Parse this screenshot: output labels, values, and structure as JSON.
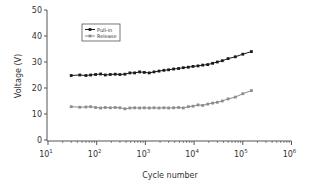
{
  "chart_data": {
    "type": "line",
    "title": "",
    "xlabel": "Cycle number",
    "ylabel": "Voltage (V)",
    "xscale": "log",
    "xlim": [
      10,
      1000000
    ],
    "ylim": [
      0,
      50
    ],
    "grid": false,
    "legend_position": "upper-left (inside)",
    "x_ticks": [
      {
        "base": "10",
        "exp": "1",
        "value": 10
      },
      {
        "base": "10",
        "exp": "2",
        "value": 100
      },
      {
        "base": "10",
        "exp": "3",
        "value": 1000
      },
      {
        "base": "10",
        "exp": "4",
        "value": 10000
      },
      {
        "base": "10",
        "exp": "5",
        "value": 100000
      },
      {
        "base": "10",
        "exp": "6",
        "value": 1000000
      }
    ],
    "y_ticks": [
      "0",
      "10",
      "20",
      "30",
      "40",
      "50"
    ],
    "series": [
      {
        "name": "Pull-in",
        "color": "#1a1a1a",
        "marker": "square",
        "x": [
          30,
          45,
          60,
          75,
          95,
          120,
          150,
          190,
          240,
          300,
          380,
          480,
          600,
          760,
          950,
          1200,
          1500,
          1900,
          2400,
          3000,
          3800,
          4800,
          6000,
          7600,
          9500,
          12000,
          15000,
          19000,
          24000,
          30000,
          38000,
          50000,
          70000,
          100000,
          150000
        ],
        "values": [
          24.8,
          25.0,
          24.8,
          25.0,
          25.2,
          25.4,
          25.0,
          25.2,
          25.3,
          25.2,
          25.3,
          25.8,
          25.8,
          26.2,
          26.0,
          25.8,
          26.2,
          26.5,
          26.8,
          27.0,
          27.3,
          27.5,
          27.8,
          28.0,
          28.3,
          28.5,
          28.8,
          29.0,
          29.5,
          30.0,
          30.5,
          31.3,
          32.0,
          33.0,
          34.0
        ]
      },
      {
        "name": "Release",
        "color": "#8c8c8c",
        "marker": "square",
        "x": [
          30,
          45,
          60,
          75,
          95,
          120,
          150,
          190,
          240,
          300,
          380,
          480,
          600,
          760,
          950,
          1200,
          1500,
          1900,
          2400,
          3000,
          3800,
          4800,
          6000,
          7600,
          9500,
          12000,
          15000,
          19000,
          24000,
          30000,
          38000,
          50000,
          70000,
          100000,
          150000
        ],
        "values": [
          12.8,
          12.6,
          12.7,
          12.8,
          12.5,
          12.3,
          12.5,
          12.4,
          12.5,
          12.4,
          12.0,
          12.3,
          12.4,
          12.3,
          12.4,
          12.3,
          12.4,
          12.3,
          12.4,
          12.3,
          12.4,
          12.5,
          12.3,
          12.8,
          13.0,
          13.5,
          13.3,
          13.8,
          14.2,
          14.5,
          15.0,
          15.8,
          16.5,
          17.8,
          19.0
        ]
      }
    ]
  }
}
